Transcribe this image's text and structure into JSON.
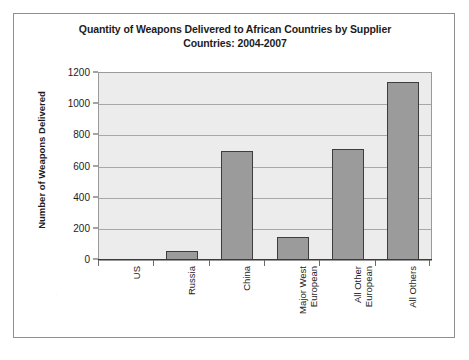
{
  "chart_data": {
    "type": "bar",
    "title": "Quantity of Weapons Delivered to African Countries by Supplier Countries: 2004-2007",
    "title_line1": "Quantity of Weapons Delivered to African Countries by Supplier",
    "title_line2": "Countries: 2004-2007",
    "xlabel": "",
    "ylabel": "Number of Weapons Delivered",
    "categories": [
      "US",
      "Russia",
      "China",
      "Major West European",
      "All Other European",
      "All Others"
    ],
    "category_labels": [
      "US",
      "Russia",
      "China",
      "Major West\nEuropean",
      "All Other\nEuropean",
      "All Others"
    ],
    "values": [
      0,
      60,
      700,
      148,
      715,
      1140
    ],
    "ylim": [
      0,
      1200
    ],
    "ytick_values": [
      0,
      200,
      400,
      600,
      800,
      1000,
      1200
    ],
    "ytick_labels": [
      "0",
      "200",
      "400",
      "600",
      "800",
      "1000",
      "1200"
    ],
    "grid": true,
    "legend": false,
    "legend_position": "none",
    "colors": {
      "bar_fill": "#9b9b9b",
      "bar_border": "#3d3d3d",
      "plot_background": "#ececed",
      "gridline": "#a8a8a8",
      "axis": "#3a3a3a",
      "text": "#1c1c1c",
      "frame": "#8f8f8f",
      "page_background": "#ffffff"
    }
  }
}
